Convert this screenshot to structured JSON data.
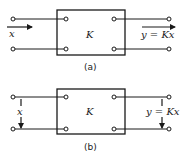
{
  "diagrams": {
    "a": {
      "caption": "(a)",
      "block_label": "K",
      "input_label": "x",
      "output_label": "y = Kx",
      "arrow_direction": "horizontal"
    },
    "b": {
      "caption": "(b)",
      "block_label": "K",
      "input_label": "x",
      "output_label": "y = Kx",
      "arrow_direction": "vertical"
    }
  },
  "colors": {
    "stroke": "#1a1a1a",
    "background": "#ffffff"
  }
}
